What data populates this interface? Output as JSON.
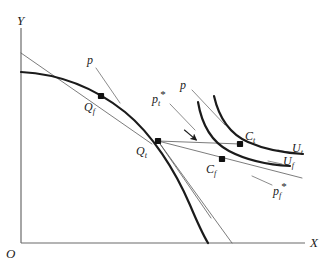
{
  "figure": {
    "type": "economics-diagram"
  },
  "axes": {
    "y_label": "Y",
    "x_label": "X",
    "origin_label": "O",
    "axis_color": "#6b6b6b",
    "x_axis": {
      "x1": 21,
      "y1": 243,
      "x2": 305,
      "y2": 243
    },
    "y_axis": {
      "x1": 21,
      "y1": 28,
      "x2": 21,
      "y2": 243
    }
  },
  "style": {
    "curve_color": "#1b1b1b",
    "thin_line_color": "#5a5a5a",
    "point_color": "#111111",
    "curve_width": 2.2,
    "thin_width": 0.8
  },
  "curves": [
    {
      "name": "ppf",
      "label": "",
      "path": "M 21 72 C 60 74 95 88 125 112 C 152 134 175 170 190 205 C 198 224 205 238 208 243"
    },
    {
      "name": "indifference-curve-tariff",
      "label": "U_t",
      "path": "M 214 96 C 219 118 230 134 248 142 C 266 150 286 153 303 154"
    },
    {
      "name": "indifference-curve-free",
      "label": "U_f",
      "path": "M 198 102 C 202 126 212 142 229 151 C 248 161 271 165 290 166"
    }
  ],
  "price_lines": [
    {
      "name": "world-price-line-qf",
      "label": "p",
      "x1": 21,
      "y1": 53,
      "x2": 152,
      "y2": 144
    },
    {
      "name": "world-price-line-qt",
      "label": "p",
      "x1": 158,
      "y1": 141,
      "x2": 302,
      "y2": 178
    },
    {
      "name": "domestic-price-tariff",
      "label": "p_t*",
      "x1": 158,
      "y1": 141,
      "x2": 232,
      "y2": 243
    },
    {
      "name": "domestic-price-free",
      "label": "p_f*",
      "x1": 158,
      "y1": 141,
      "x2": 211,
      "y2": 218
    },
    {
      "name": "trade-line-qt-ct",
      "label": "",
      "x1": 158,
      "y1": 141,
      "x2": 240,
      "y2": 144
    }
  ],
  "leader_lines": [
    {
      "name": "leader-p-qf",
      "x1": 96,
      "y1": 68,
      "x2": 120,
      "y2": 103
    },
    {
      "name": "leader-p-qt",
      "x1": 192,
      "y1": 90,
      "x2": 225,
      "y2": 125
    },
    {
      "name": "leader-pt-star",
      "x1": 170,
      "y1": 104,
      "x2": 195,
      "y2": 130
    },
    {
      "name": "leader-ut",
      "x1": 278,
      "y1": 150,
      "x2": 292,
      "y2": 153
    },
    {
      "name": "leader-uf",
      "x1": 268,
      "y1": 161,
      "x2": 282,
      "y2": 164
    },
    {
      "name": "leader-pf-star",
      "x1": 252,
      "y1": 176,
      "x2": 272,
      "y2": 185
    }
  ],
  "arrow": {
    "name": "trade-direction-arrow",
    "x": 188,
    "y": 133,
    "angle": 40
  },
  "points": [
    {
      "name": "point-qf",
      "label": "Q_f",
      "base": "Q",
      "sub": "f",
      "star": false,
      "x": 101,
      "y": 96,
      "label_x": 84,
      "label_y": 101
    },
    {
      "name": "point-qt",
      "label": "Q_t",
      "base": "Q",
      "sub": "t",
      "star": false,
      "x": 158,
      "y": 141,
      "label_x": 136,
      "label_y": 145
    },
    {
      "name": "point-ct",
      "label": "C_t",
      "base": "C",
      "sub": "t",
      "star": false,
      "x": 240,
      "y": 144,
      "label_x": 245,
      "label_y": 130
    },
    {
      "name": "point-cf",
      "label": "C_f",
      "base": "C",
      "sub": "f",
      "star": false,
      "x": 222,
      "y": 159,
      "label_x": 206,
      "label_y": 163
    }
  ],
  "labels": [
    {
      "name": "label-y-axis",
      "text": "Y",
      "base": "Y",
      "sub": "",
      "star": false,
      "x": 17,
      "y": 14,
      "cls": "axlbl"
    },
    {
      "name": "label-x-axis",
      "text": "X",
      "base": "X",
      "sub": "",
      "star": false,
      "x": 310,
      "y": 236,
      "cls": "axlbl"
    },
    {
      "name": "label-origin",
      "text": "O",
      "base": "O",
      "sub": "",
      "star": false,
      "x": 6,
      "y": 247,
      "cls": "axlbl"
    },
    {
      "name": "label-p-left",
      "text": "p",
      "base": "p",
      "sub": "",
      "star": false,
      "x": 87,
      "y": 54,
      "cls": "prlbl"
    },
    {
      "name": "label-p-right",
      "text": "p",
      "base": "p",
      "sub": "",
      "star": false,
      "x": 180,
      "y": 79,
      "cls": "prlbl"
    },
    {
      "name": "label-pt-star",
      "text": "p_t*",
      "base": "p",
      "sub": "t",
      "star": true,
      "x": 152,
      "y": 89,
      "cls": "prlbl"
    },
    {
      "name": "label-pf-star",
      "text": "p_f*",
      "base": "p",
      "sub": "f",
      "star": true,
      "x": 273,
      "y": 181,
      "cls": "prlbl"
    },
    {
      "name": "label-ut",
      "text": "U_t",
      "base": "U",
      "sub": "t",
      "star": false,
      "x": 292,
      "y": 142,
      "cls": "culbl"
    },
    {
      "name": "label-uf",
      "text": "U_f",
      "base": "U",
      "sub": "f",
      "star": false,
      "x": 283,
      "y": 155,
      "cls": "culbl"
    }
  ]
}
